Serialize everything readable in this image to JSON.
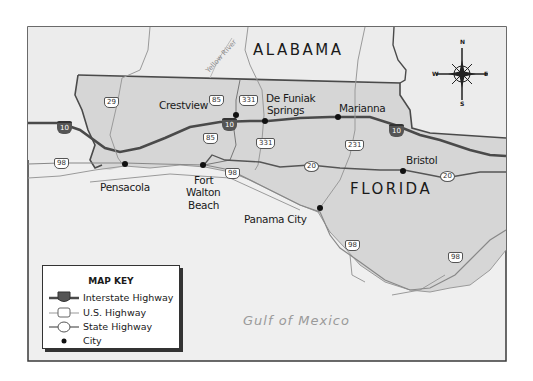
{
  "map": {
    "states": {
      "alabama": "ALABAMA",
      "florida": "FLORIDA"
    },
    "water": {
      "gulf": "Gulf of Mexico",
      "river": "Yellow River"
    },
    "cities": [
      {
        "name": "Crestview"
      },
      {
        "name_line1": "De Funiak",
        "name_line2": "Springs"
      },
      {
        "name": "Marianna"
      },
      {
        "name": "Bristol"
      },
      {
        "name": "Pensacola"
      },
      {
        "name_line1": "Fort",
        "name_line2": "Walton",
        "name_line3": "Beach"
      },
      {
        "name": "Panama City"
      }
    ],
    "highways": {
      "interstate": "10",
      "us": [
        "29",
        "85",
        "331",
        "231",
        "98"
      ],
      "state": [
        "20"
      ]
    },
    "compass": {
      "n": "N",
      "s": "S",
      "e": "E",
      "w": "W"
    },
    "colors": {
      "florida_fill": "#d6d6d6",
      "land_fill": "#ececec",
      "water_fill": "#f0f0f0",
      "interstate_line": "#4a4a4a",
      "border_line": "#4a4a4a",
      "minor_road": "#9a9a9a"
    }
  },
  "legend": {
    "title": "MAP KEY",
    "items": [
      {
        "symbol": "interstate-shield",
        "shield_text": "10",
        "label": "Interstate Highway"
      },
      {
        "symbol": "us-shield",
        "shield_text": "29",
        "label": "U.S. Highway"
      },
      {
        "symbol": "state-shield",
        "shield_text": "20",
        "label": "State Highway"
      },
      {
        "symbol": "dot",
        "label": "City"
      }
    ]
  }
}
